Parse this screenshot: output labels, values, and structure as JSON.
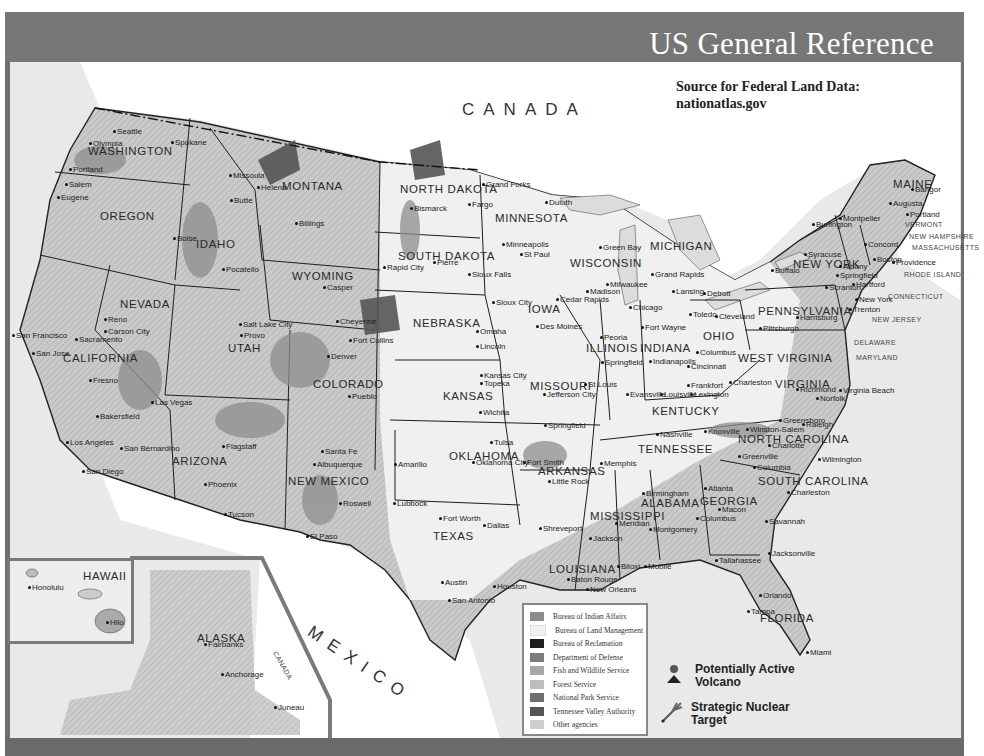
{
  "header": {
    "title": "US General Reference"
  },
  "source_note": {
    "line1": "Source for Federal Land Data:",
    "line2": "nationatlas.gov"
  },
  "countries": {
    "canada": "CANADA",
    "mexico": "MEXICO",
    "canada_alaska": "CANADA"
  },
  "states": [
    {
      "name": "WASHINGTON",
      "x": 88,
      "y": 145
    },
    {
      "name": "OREGON",
      "x": 100,
      "y": 210
    },
    {
      "name": "IDAHO",
      "x": 196,
      "y": 238
    },
    {
      "name": "MONTANA",
      "x": 282,
      "y": 180
    },
    {
      "name": "WYOMING",
      "x": 292,
      "y": 270
    },
    {
      "name": "NORTH DAKOTA",
      "x": 400,
      "y": 183
    },
    {
      "name": "SOUTH DAKOTA",
      "x": 398,
      "y": 250
    },
    {
      "name": "MINNESOTA",
      "x": 495,
      "y": 212
    },
    {
      "name": "WISCONSIN",
      "x": 570,
      "y": 257
    },
    {
      "name": "MICHIGAN",
      "x": 650,
      "y": 240
    },
    {
      "name": "IOWA",
      "x": 528,
      "y": 303
    },
    {
      "name": "NEBRASKA",
      "x": 413,
      "y": 317
    },
    {
      "name": "NEVADA",
      "x": 120,
      "y": 298
    },
    {
      "name": "UTAH",
      "x": 228,
      "y": 342
    },
    {
      "name": "COLORADO",
      "x": 313,
      "y": 378
    },
    {
      "name": "CALIFORNIA",
      "x": 63,
      "y": 352
    },
    {
      "name": "KANSAS",
      "x": 443,
      "y": 390
    },
    {
      "name": "MISSOURI",
      "x": 530,
      "y": 380
    },
    {
      "name": "ILLINOIS",
      "x": 586,
      "y": 342
    },
    {
      "name": "INDIANA",
      "x": 640,
      "y": 342
    },
    {
      "name": "OHIO",
      "x": 703,
      "y": 330
    },
    {
      "name": "KENTUCKY",
      "x": 652,
      "y": 405
    },
    {
      "name": "WEST VIRGINIA",
      "x": 738,
      "y": 352
    },
    {
      "name": "VIRGINIA",
      "x": 775,
      "y": 378
    },
    {
      "name": "PENNSYLVANIA",
      "x": 758,
      "y": 305
    },
    {
      "name": "NEW YORK",
      "x": 793,
      "y": 258
    },
    {
      "name": "MAINE",
      "x": 893,
      "y": 178
    },
    {
      "name": "TENNESSEE",
      "x": 638,
      "y": 443
    },
    {
      "name": "NORTH CAROLINA",
      "x": 738,
      "y": 433
    },
    {
      "name": "SOUTH CAROLINA",
      "x": 758,
      "y": 475
    },
    {
      "name": "ARKANSAS",
      "x": 538,
      "y": 465
    },
    {
      "name": "OKLAHOMA",
      "x": 449,
      "y": 450
    },
    {
      "name": "ARIZONA",
      "x": 172,
      "y": 455
    },
    {
      "name": "NEW MEXICO",
      "x": 288,
      "y": 475
    },
    {
      "name": "TEXAS",
      "x": 433,
      "y": 530
    },
    {
      "name": "LOUISIANA",
      "x": 549,
      "y": 563
    },
    {
      "name": "MISSISSIPPI",
      "x": 590,
      "y": 510
    },
    {
      "name": "ALABAMA",
      "x": 641,
      "y": 497
    },
    {
      "name": "GEORGIA",
      "x": 700,
      "y": 495
    },
    {
      "name": "FLORIDA",
      "x": 760,
      "y": 612
    },
    {
      "name": "ALASKA",
      "x": 197,
      "y": 632
    },
    {
      "name": "HAWAII",
      "x": 83,
      "y": 570
    }
  ],
  "small_states": [
    {
      "name": "VERMONT",
      "x": 905,
      "y": 221
    },
    {
      "name": "NEW HAMPSHIRE",
      "x": 909,
      "y": 233
    },
    {
      "name": "MASSACHUSETTS",
      "x": 912,
      "y": 244
    },
    {
      "name": "RHODE ISLAND",
      "x": 904,
      "y": 271
    },
    {
      "name": "CONNECTICUT",
      "x": 888,
      "y": 293
    },
    {
      "name": "NEW JERSEY",
      "x": 872,
      "y": 316
    },
    {
      "name": "DELAWARE",
      "x": 854,
      "y": 339
    },
    {
      "name": "MARYLAND",
      "x": 856,
      "y": 354
    }
  ],
  "cities": [
    {
      "name": "Seattle",
      "x": 117,
      "y": 127
    },
    {
      "name": "Olympia",
      "x": 93,
      "y": 139
    },
    {
      "name": "Spokane",
      "x": 175,
      "y": 138
    },
    {
      "name": "Portland",
      "x": 73,
      "y": 165
    },
    {
      "name": "Salem",
      "x": 69,
      "y": 180
    },
    {
      "name": "Eugene",
      "x": 61,
      "y": 193
    },
    {
      "name": "Boise",
      "x": 177,
      "y": 234
    },
    {
      "name": "Pocatello",
      "x": 226,
      "y": 265
    },
    {
      "name": "Missoula",
      "x": 233,
      "y": 171
    },
    {
      "name": "Helena",
      "x": 261,
      "y": 183
    },
    {
      "name": "Butte",
      "x": 234,
      "y": 196
    },
    {
      "name": "Billings",
      "x": 299,
      "y": 219
    },
    {
      "name": "Casper",
      "x": 327,
      "y": 283
    },
    {
      "name": "Cheyenne",
      "x": 340,
      "y": 317
    },
    {
      "name": "Bismarck",
      "x": 414,
      "y": 204
    },
    {
      "name": "Fargo",
      "x": 472,
      "y": 200
    },
    {
      "name": "Grand Forks",
      "x": 486,
      "y": 180
    },
    {
      "name": "Duluth",
      "x": 549,
      "y": 198
    },
    {
      "name": "Minneapolis",
      "x": 506,
      "y": 240
    },
    {
      "name": "St Paul",
      "x": 524,
      "y": 250
    },
    {
      "name": "Pierre",
      "x": 437,
      "y": 258
    },
    {
      "name": "Rapid City",
      "x": 387,
      "y": 263
    },
    {
      "name": "Sioux Falls",
      "x": 472,
      "y": 270
    },
    {
      "name": "Sioux City",
      "x": 496,
      "y": 298
    },
    {
      "name": "Omaha",
      "x": 480,
      "y": 327
    },
    {
      "name": "Lincoln",
      "x": 480,
      "y": 342
    },
    {
      "name": "Des Moines",
      "x": 540,
      "y": 322
    },
    {
      "name": "Cedar Rapids",
      "x": 560,
      "y": 295
    },
    {
      "name": "Green Bay",
      "x": 603,
      "y": 243
    },
    {
      "name": "Milwaukee",
      "x": 610,
      "y": 280
    },
    {
      "name": "Madison",
      "x": 590,
      "y": 287
    },
    {
      "name": "Chicago",
      "x": 633,
      "y": 303
    },
    {
      "name": "Grand Rapids",
      "x": 655,
      "y": 270
    },
    {
      "name": "Lansing",
      "x": 676,
      "y": 287
    },
    {
      "name": "Detroit",
      "x": 707,
      "y": 289
    },
    {
      "name": "Toledo",
      "x": 693,
      "y": 310
    },
    {
      "name": "Cleveland",
      "x": 719,
      "y": 312
    },
    {
      "name": "Buffalo",
      "x": 775,
      "y": 266
    },
    {
      "name": "Syracuse",
      "x": 808,
      "y": 250
    },
    {
      "name": "Burlington",
      "x": 816,
      "y": 220
    },
    {
      "name": "Montpelier",
      "x": 843,
      "y": 214
    },
    {
      "name": "Augusta",
      "x": 893,
      "y": 199
    },
    {
      "name": "Bangor",
      "x": 915,
      "y": 185
    },
    {
      "name": "Portland",
      "x": 910,
      "y": 210
    },
    {
      "name": "Concord",
      "x": 868,
      "y": 240
    },
    {
      "name": "Boston",
      "x": 877,
      "y": 255
    },
    {
      "name": "Albany",
      "x": 843,
      "y": 262
    },
    {
      "name": "Springfield",
      "x": 840,
      "y": 271
    },
    {
      "name": "Hartford",
      "x": 856,
      "y": 280
    },
    {
      "name": "Providence",
      "x": 896,
      "y": 258
    },
    {
      "name": "Scranton",
      "x": 829,
      "y": 283
    },
    {
      "name": "New York",
      "x": 859,
      "y": 295
    },
    {
      "name": "Trenton",
      "x": 853,
      "y": 305
    },
    {
      "name": "Harrisburg",
      "x": 800,
      "y": 313
    },
    {
      "name": "Pittsburgh",
      "x": 763,
      "y": 324
    },
    {
      "name": "Fort Wayne",
      "x": 645,
      "y": 323
    },
    {
      "name": "Peoria",
      "x": 604,
      "y": 333
    },
    {
      "name": "Springfield",
      "x": 605,
      "y": 358
    },
    {
      "name": "Indianapolis",
      "x": 653,
      "y": 357
    },
    {
      "name": "Columbus",
      "x": 700,
      "y": 348
    },
    {
      "name": "Cincinnati",
      "x": 691,
      "y": 362
    },
    {
      "name": "Charleston",
      "x": 733,
      "y": 378
    },
    {
      "name": "Richmond",
      "x": 800,
      "y": 385
    },
    {
      "name": "Norfolk",
      "x": 820,
      "y": 394
    },
    {
      "name": "Virginia Beach",
      "x": 843,
      "y": 386
    },
    {
      "name": "Frankfort",
      "x": 691,
      "y": 381
    },
    {
      "name": "Lexington",
      "x": 694,
      "y": 390
    },
    {
      "name": "Louisville",
      "x": 664,
      "y": 390
    },
    {
      "name": "Evansville",
      "x": 630,
      "y": 390
    },
    {
      "name": "St Louis",
      "x": 588,
      "y": 380
    },
    {
      "name": "Jefferson City",
      "x": 547,
      "y": 390
    },
    {
      "name": "Kansas City",
      "x": 484,
      "y": 371
    },
    {
      "name": "Topeka",
      "x": 484,
      "y": 379
    },
    {
      "name": "Wichita",
      "x": 483,
      "y": 408
    },
    {
      "name": "Springfield",
      "x": 548,
      "y": 421
    },
    {
      "name": "Nashville",
      "x": 660,
      "y": 430
    },
    {
      "name": "Knoxville",
      "x": 708,
      "y": 427
    },
    {
      "name": "Winston-Salem",
      "x": 750,
      "y": 425
    },
    {
      "name": "Greensboro",
      "x": 783,
      "y": 416
    },
    {
      "name": "Raleigh",
      "x": 806,
      "y": 420
    },
    {
      "name": "Charlotte",
      "x": 772,
      "y": 441
    },
    {
      "name": "Wilmington",
      "x": 822,
      "y": 455
    },
    {
      "name": "Greenville",
      "x": 742,
      "y": 452
    },
    {
      "name": "Columbia",
      "x": 757,
      "y": 463
    },
    {
      "name": "Charleston",
      "x": 791,
      "y": 488
    },
    {
      "name": "Savannah",
      "x": 769,
      "y": 517
    },
    {
      "name": "Memphis",
      "x": 604,
      "y": 459
    },
    {
      "name": "Little Rock",
      "x": 552,
      "y": 477
    },
    {
      "name": "Fort Smith",
      "x": 527,
      "y": 458
    },
    {
      "name": "Tulsa",
      "x": 494,
      "y": 438
    },
    {
      "name": "Oklahoma City",
      "x": 476,
      "y": 458
    },
    {
      "name": "Amarillo",
      "x": 398,
      "y": 460
    },
    {
      "name": "Lubbock",
      "x": 397,
      "y": 499
    },
    {
      "name": "Fort Worth",
      "x": 443,
      "y": 514
    },
    {
      "name": "Dallas",
      "x": 487,
      "y": 521
    },
    {
      "name": "Shreveport",
      "x": 543,
      "y": 524
    },
    {
      "name": "Jackson",
      "x": 593,
      "y": 534
    },
    {
      "name": "Meridian",
      "x": 619,
      "y": 519
    },
    {
      "name": "Birmingham",
      "x": 646,
      "y": 489
    },
    {
      "name": "Atlanta",
      "x": 708,
      "y": 484
    },
    {
      "name": "Macon",
      "x": 722,
      "y": 505
    },
    {
      "name": "Columbus",
      "x": 700,
      "y": 514
    },
    {
      "name": "Montgomery",
      "x": 653,
      "y": 525
    },
    {
      "name": "Tallahassee",
      "x": 719,
      "y": 556
    },
    {
      "name": "Jacksonville",
      "x": 772,
      "y": 549
    },
    {
      "name": "Orlando",
      "x": 763,
      "y": 591
    },
    {
      "name": "Tampa",
      "x": 751,
      "y": 607
    },
    {
      "name": "Miami",
      "x": 810,
      "y": 648
    },
    {
      "name": "Mobile",
      "x": 648,
      "y": 562
    },
    {
      "name": "Biloxi",
      "x": 621,
      "y": 562
    },
    {
      "name": "Baton Rouge",
      "x": 571,
      "y": 575
    },
    {
      "name": "New Orleans",
      "x": 590,
      "y": 585
    },
    {
      "name": "Austin",
      "x": 445,
      "y": 578
    },
    {
      "name": "San Antonio",
      "x": 452,
      "y": 596
    },
    {
      "name": "Houston",
      "x": 497,
      "y": 582
    },
    {
      "name": "El Paso",
      "x": 310,
      "y": 532
    },
    {
      "name": "Roswell",
      "x": 343,
      "y": 499
    },
    {
      "name": "Santa Fe",
      "x": 325,
      "y": 447
    },
    {
      "name": "Albuquerque",
      "x": 317,
      "y": 460
    },
    {
      "name": "Flagstaff",
      "x": 226,
      "y": 442
    },
    {
      "name": "Phoenix",
      "x": 208,
      "y": 480
    },
    {
      "name": "Tucson",
      "x": 228,
      "y": 510
    },
    {
      "name": "Denver",
      "x": 331,
      "y": 352
    },
    {
      "name": "Fort Collins",
      "x": 353,
      "y": 336
    },
    {
      "name": "Pueblo",
      "x": 352,
      "y": 392
    },
    {
      "name": "Salt Lake City",
      "x": 243,
      "y": 320
    },
    {
      "name": "Provo",
      "x": 244,
      "y": 331
    },
    {
      "name": "Reno",
      "x": 108,
      "y": 315
    },
    {
      "name": "Carson City",
      "x": 108,
      "y": 327
    },
    {
      "name": "Sacramento",
      "x": 79,
      "y": 335
    },
    {
      "name": "San Francisco",
      "x": 16,
      "y": 331
    },
    {
      "name": "San Jose",
      "x": 36,
      "y": 349
    },
    {
      "name": "Fresno",
      "x": 93,
      "y": 376
    },
    {
      "name": "Bakersfield",
      "x": 100,
      "y": 412
    },
    {
      "name": "Los Angeles",
      "x": 70,
      "y": 438
    },
    {
      "name": "San Bernardino",
      "x": 124,
      "y": 444
    },
    {
      "name": "San Diego",
      "x": 86,
      "y": 467
    },
    {
      "name": "Las Vegas",
      "x": 155,
      "y": 398
    },
    {
      "name": "Honolulu",
      "x": 32,
      "y": 583
    },
    {
      "name": "Hilo",
      "x": 110,
      "y": 618
    },
    {
      "name": "Fairbanks",
      "x": 208,
      "y": 640
    },
    {
      "name": "Anchorage",
      "x": 225,
      "y": 670
    },
    {
      "name": "Juneau",
      "x": 278,
      "y": 703
    }
  ],
  "legend": {
    "title": "Federal Lands",
    "items": [
      {
        "label": "Bureau of Indian Affairs",
        "color": "#8c8c8c"
      },
      {
        "label": "Bureau of Land Management",
        "color": "#f0f0f0"
      },
      {
        "label": "Bureau of Reclamation",
        "color": "#1f1f1f"
      },
      {
        "label": "Department of Defense",
        "color": "#7c7c7c"
      },
      {
        "label": "Fish and Wildlife Service",
        "color": "#a8a8a8"
      },
      {
        "label": "Forest Service",
        "color": "#bdbdbd"
      },
      {
        "label": "National Park Service",
        "color": "#6f6f6f"
      },
      {
        "label": "Tennessee Valley Authority",
        "color": "#555555"
      },
      {
        "label": "Other agencies",
        "color": "#cfcfcf"
      }
    ]
  },
  "symbols": {
    "volcano": {
      "label_line1": "Potentially Active",
      "label_line2": "Volcano",
      "icon": "volcano-icon"
    },
    "nuclear": {
      "label_line1": "Strategic Nuclear",
      "label_line2": "Target",
      "icon": "missile-target-icon"
    }
  },
  "colors": {
    "frame": "#6f6f6f",
    "header": "#767676",
    "land": "#f4f4f4",
    "water": "#e6e6e6",
    "federal": "#9a9a9a",
    "border": "#2a2a2a"
  }
}
